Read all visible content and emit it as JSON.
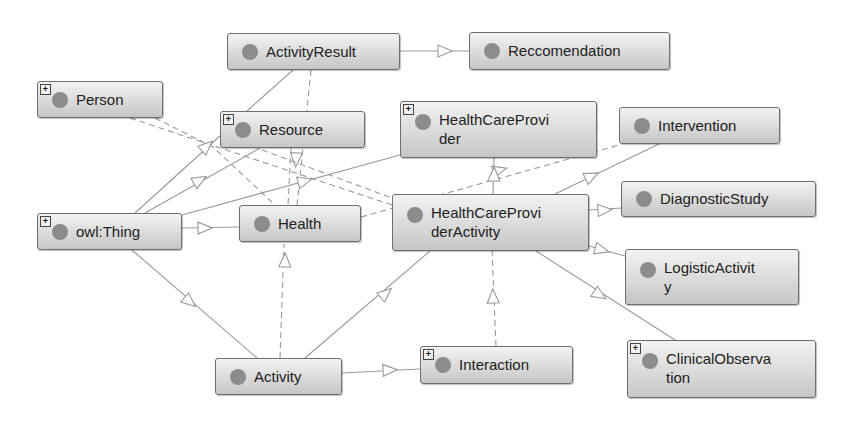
{
  "diagram": {
    "type": "ontology-class-graph",
    "nodes": [
      {
        "id": "activity_result",
        "label": "ActivityResult",
        "expandable": false,
        "x": 227,
        "y": 33,
        "w": 173,
        "h": 37
      },
      {
        "id": "reccomendation",
        "label": "Reccomendation",
        "expandable": false,
        "x": 469,
        "y": 32,
        "w": 201,
        "h": 38
      },
      {
        "id": "person",
        "label": "Person",
        "expandable": true,
        "x": 37,
        "y": 81,
        "w": 126,
        "h": 37
      },
      {
        "id": "resource",
        "label": "Resource",
        "expandable": true,
        "x": 220,
        "y": 111,
        "w": 145,
        "h": 37
      },
      {
        "id": "health_care_provider",
        "label": "HealthCareProvi\nder",
        "expandable": true,
        "x": 400,
        "y": 101,
        "w": 197,
        "h": 57
      },
      {
        "id": "intervention",
        "label": "Intervention",
        "expandable": false,
        "x": 619,
        "y": 107,
        "w": 161,
        "h": 37
      },
      {
        "id": "owl_thing",
        "label": "owl:Thing",
        "expandable": true,
        "x": 37,
        "y": 213,
        "w": 145,
        "h": 37
      },
      {
        "id": "health",
        "label": "Health",
        "expandable": false,
        "x": 239,
        "y": 205,
        "w": 122,
        "h": 37
      },
      {
        "id": "health_care_provider_activity",
        "label": "HealthCareProvi\nderActivity",
        "expandable": false,
        "x": 392,
        "y": 194,
        "w": 197,
        "h": 57
      },
      {
        "id": "diagnostic_study",
        "label": "DiagnosticStudy",
        "expandable": false,
        "x": 621,
        "y": 181,
        "w": 195,
        "h": 36
      },
      {
        "id": "logistic_activity",
        "label": "LogisticActivit\ny",
        "expandable": false,
        "x": 625,
        "y": 249,
        "w": 174,
        "h": 56
      },
      {
        "id": "activity",
        "label": "Activity",
        "expandable": false,
        "x": 215,
        "y": 358,
        "w": 127,
        "h": 37
      },
      {
        "id": "interaction",
        "label": "Interaction",
        "expandable": true,
        "x": 420,
        "y": 346,
        "w": 153,
        "h": 38
      },
      {
        "id": "clinical_observation",
        "label": "ClinicalObserva\ntion",
        "expandable": true,
        "x": 627,
        "y": 340,
        "w": 189,
        "h": 58
      }
    ],
    "edges": [
      {
        "from": "activity_result",
        "to": "reccomendation",
        "style": "solid",
        "points": [
          [
            400,
            51
          ],
          [
            469,
            51
          ]
        ],
        "arrow": [
          445,
          51
        ]
      },
      {
        "from": "activity_result",
        "to": "resource",
        "style": "solid",
        "points": [
          [
            293,
            70
          ],
          [
            247,
            111
          ]
        ],
        "arrow": null
      },
      {
        "from": "activity_result",
        "to": "health",
        "style": "dashed",
        "points": [
          [
            311,
            70
          ],
          [
            297,
            205
          ]
        ],
        "arrow": null
      },
      {
        "from": "person",
        "to": "health_care_provider_activity",
        "style": "dashed",
        "points": [
          [
            130,
            118
          ],
          [
            392,
            205
          ]
        ],
        "arrow": null
      },
      {
        "from": "person",
        "to": "health",
        "style": "dashed",
        "points": [
          [
            155,
            118
          ],
          [
            213,
            147
          ],
          [
            275,
            205
          ]
        ],
        "arrow": null
      },
      {
        "from": "owl_thing",
        "to": "resource",
        "style": "solid",
        "points": [
          [
            135,
            213
          ],
          [
            220,
            136
          ]
        ],
        "arrow": [
          207,
          146
        ]
      },
      {
        "from": "owl_thing",
        "to": "resource",
        "style": "solid",
        "points": [
          [
            145,
            213
          ],
          [
            260,
            148
          ]
        ],
        "arrow": [
          200,
          180
        ]
      },
      {
        "from": "owl_thing",
        "to": "health_care_provider",
        "style": "solid",
        "points": [
          [
            182,
            215
          ],
          [
            400,
            155
          ]
        ],
        "arrow": [
          305,
          181
        ]
      },
      {
        "from": "owl_thing",
        "to": "health",
        "style": "solid",
        "points": [
          [
            182,
            228
          ],
          [
            239,
            227
          ]
        ],
        "arrow": [
          205,
          228
        ]
      },
      {
        "from": "owl_thing",
        "to": "activity",
        "style": "solid",
        "points": [
          [
            132,
            250
          ],
          [
            257,
            358
          ]
        ],
        "arrow": [
          190,
          302
        ]
      },
      {
        "from": "resource",
        "to": "health",
        "style": "dashed",
        "points": [
          [
            291,
            148
          ],
          [
            288,
            205
          ]
        ],
        "arrow": [
          296,
          160
        ]
      },
      {
        "from": "resource",
        "to": "health_care_provider_activity",
        "style": "dashed",
        "points": [
          [
            262,
            150
          ],
          [
            392,
            198
          ]
        ],
        "arrow": null
      },
      {
        "from": "health",
        "to": "intervention",
        "style": "dashed",
        "points": [
          [
            361,
            217
          ],
          [
            619,
            145
          ]
        ],
        "arrow": [
          500,
          170
        ]
      },
      {
        "from": "health_care_provider_activity",
        "to": "health_care_provider",
        "style": "solid",
        "points": [
          [
            493,
            194
          ],
          [
            494,
            158
          ]
        ],
        "arrow": [
          494,
          174
        ]
      },
      {
        "from": "health_care_provider_activity",
        "to": "intervention",
        "style": "solid",
        "points": [
          [
            555,
            194
          ],
          [
            659,
            144
          ]
        ],
        "arrow": [
          592,
          176
        ]
      },
      {
        "from": "health_care_provider_activity",
        "to": "diagnostic_study",
        "style": "solid",
        "points": [
          [
            589,
            210
          ],
          [
            621,
            208
          ]
        ],
        "arrow": [
          605,
          210
        ]
      },
      {
        "from": "health_care_provider_activity",
        "to": "logistic_activity",
        "style": "solid",
        "points": [
          [
            589,
            246
          ],
          [
            625,
            256
          ]
        ],
        "arrow": [
          602,
          250
        ]
      },
      {
        "from": "health_care_provider_activity",
        "to": "clinical_observation",
        "style": "solid",
        "points": [
          [
            536,
            251
          ],
          [
            675,
            340
          ]
        ],
        "arrow": [
          600,
          295
        ]
      },
      {
        "from": "activity",
        "to": "health",
        "style": "dashed",
        "points": [
          [
            280,
            358
          ],
          [
            284,
            244
          ]
        ],
        "arrow": [
          285,
          260
        ]
      },
      {
        "from": "activity",
        "to": "health_care_provider_activity",
        "style": "solid",
        "points": [
          [
            305,
            358
          ],
          [
            430,
            251
          ]
        ],
        "arrow": [
          386,
          293
        ]
      },
      {
        "from": "activity",
        "to": "interaction",
        "style": "solid",
        "points": [
          [
            342,
            373
          ],
          [
            420,
            369
          ]
        ],
        "arrow": [
          390,
          370
        ]
      },
      {
        "from": "interaction",
        "to": "health_care_provider_activity",
        "style": "dashed",
        "points": [
          [
            496,
            346
          ],
          [
            492,
            251
          ]
        ],
        "arrow": [
          493,
          296
        ]
      }
    ]
  },
  "colors": {
    "node_border": "#6e6e6e",
    "node_fill_top": "#f3f3f3",
    "node_fill_bottom": "#c6c6c6",
    "class_dot": "#8c8c8c",
    "edge": "#9a9a9a",
    "text": "#222222"
  },
  "icons": {
    "class_marker": "class-dot-icon",
    "expand": "expand-plus-icon",
    "expand_glyph": "+"
  }
}
